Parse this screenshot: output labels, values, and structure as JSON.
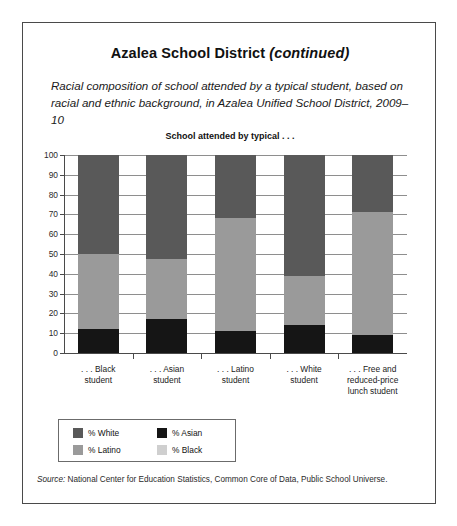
{
  "figure": {
    "title_main": "Azalea School District",
    "title_continued": "(continued)",
    "subtitle": "Racial composition of school attended by a typical student, based on racial and ethnic background, in Azalea Unified School District, 2009–10",
    "chart_header": "School attended by typical . . .",
    "source_word": "Source:",
    "source_text": " National Center for Education Statistics, Common Core of Data, Public School Universe."
  },
  "colors": {
    "white_series": "#595959",
    "latino_series": "#9a9a9a",
    "black_series": "#cfcfcf",
    "asian_series": "#151515",
    "gridline": "#8e8e8e",
    "axis": "#4a4a4a",
    "frame": "#4a4a4a"
  },
  "legend": {
    "items": [
      {
        "label": "% White",
        "color": "#595959",
        "swatch_name": "legend-swatch-white"
      },
      {
        "label": "% Asian",
        "color": "#151515",
        "swatch_name": "legend-swatch-asian"
      },
      {
        "label": "% Latino",
        "color": "#9a9a9a",
        "swatch_name": "legend-swatch-latino"
      },
      {
        "label": "% Black",
        "color": "#cfcfcf",
        "swatch_name": "legend-swatch-black"
      }
    ]
  },
  "chart_data": {
    "type": "bar",
    "subtype": "stacked-bar-100",
    "title": "School attended by typical . . .",
    "xlabel": "",
    "ylabel": "",
    "ylim": [
      0,
      100
    ],
    "yticks": [
      0,
      10,
      20,
      30,
      40,
      50,
      60,
      70,
      80,
      90,
      100
    ],
    "ytick_labels": [
      "0",
      "10",
      "20",
      "30",
      "40",
      "50",
      "60",
      "70",
      "80",
      "90",
      "100"
    ],
    "grid": true,
    "legend_position": "below-left",
    "categories": [
      ". . . Black\nstudent",
      ". . . Asian\nstudent",
      ". . . Latino\nstudent",
      ". . . White\nstudent",
      ". . . Free and\nreduced-price\nlunch student"
    ],
    "category_lines": [
      [
        ". . . Black",
        "student"
      ],
      [
        ". . . Asian",
        "student"
      ],
      [
        ". . . Latino",
        "student"
      ],
      [
        ". . . White",
        "student"
      ],
      [
        ". . . Free and",
        "reduced-price",
        "lunch student"
      ]
    ],
    "series": [
      {
        "name": "% Asian",
        "color": "#151515",
        "values": [
          12,
          17,
          11,
          14,
          9
        ]
      },
      {
        "name": "% Latino",
        "color": "#9a9a9a",
        "values": [
          38,
          30.5,
          57,
          25,
          62
        ]
      },
      {
        "name": "% White",
        "color": "#595959",
        "values": [
          50,
          52.5,
          32,
          61,
          29
        ]
      }
    ],
    "stack_order_bottom_to_top": [
      "% Asian",
      "% Latino",
      "% White"
    ],
    "segment_boundaries": {
      ". . . Black student": {
        "asian_top": 12,
        "latino_top": 50,
        "white_top": 100
      },
      ". . . Asian student": {
        "asian_top": 17,
        "latino_top": 47.5,
        "white_top": 100
      },
      ". . . Latino student": {
        "asian_top": 11,
        "latino_top": 68,
        "white_top": 100
      },
      ". . . White student": {
        "asian_top": 14,
        "latino_top": 39,
        "white_top": 100
      },
      ". . . Free and reduced-price lunch student": {
        "asian_top": 9,
        "latino_top": 71,
        "white_top": 100
      }
    }
  }
}
